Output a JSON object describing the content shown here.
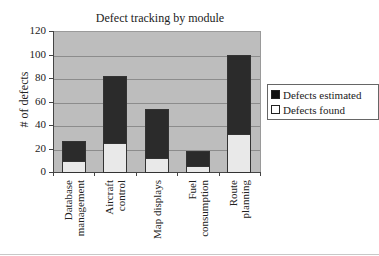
{
  "chart_data": {
    "type": "bar",
    "stacked": true,
    "title": "Defect tracking by module",
    "xlabel": "",
    "ylabel": "# of defects",
    "ylim": [
      0,
      120
    ],
    "yticks": [
      "0",
      "20",
      "40",
      "60",
      "80",
      "100",
      "120"
    ],
    "categories": [
      "Database management",
      "Aircraft control",
      "Map displays",
      "Fuel consumption",
      "Route planning"
    ],
    "category_lines": [
      [
        "Database",
        "management"
      ],
      [
        "Aircraft",
        "control"
      ],
      [
        "Map displays"
      ],
      [
        "Fuel",
        "consumption"
      ],
      [
        "Route",
        "planning"
      ]
    ],
    "series": [
      {
        "name": "Defects found",
        "color": "#e9e9e9",
        "values": [
          9,
          25,
          12,
          5,
          32
        ]
      },
      {
        "name": "Defects estimated",
        "color": "#2b2b2b",
        "totals": [
          26,
          82,
          54,
          18,
          100
        ],
        "values": [
          17,
          57,
          42,
          13,
          68
        ]
      }
    ],
    "grid": true,
    "legend_position": "right",
    "legend": [
      "Defects estimated",
      "Defects found"
    ]
  }
}
